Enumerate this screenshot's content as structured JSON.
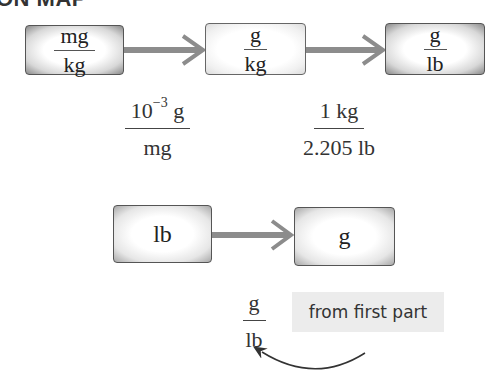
{
  "heading": "ON MAP",
  "row1": {
    "boxes": [
      {
        "numerator": "mg",
        "denominator": "kg",
        "style": "dark"
      },
      {
        "numerator": "g",
        "denominator": "kg",
        "style": "light"
      },
      {
        "numerator": "g",
        "denominator": "lb",
        "style": "dark"
      }
    ],
    "conversion_factors": [
      {
        "numerator_base": "10",
        "numerator_exp": "−3",
        "numerator_unit": " g",
        "denominator": "mg"
      },
      {
        "numerator": "1 kg",
        "denominator": "2.205 lb"
      }
    ]
  },
  "row2": {
    "boxes": [
      {
        "label": "lb"
      },
      {
        "label": "g"
      }
    ],
    "conversion_factor": {
      "numerator": "g",
      "denominator": "lb"
    },
    "note": "from first part"
  },
  "colors": {
    "arrow": "#8c8c8c",
    "border": "#555555",
    "note_bg": "#ececec"
  }
}
